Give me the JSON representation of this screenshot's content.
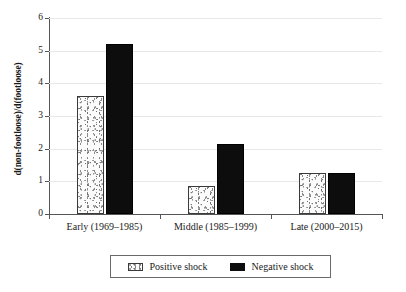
{
  "chart_data": {
    "type": "bar",
    "title": "",
    "xlabel": "",
    "ylabel": "d(non-footloose)/d(footloose)",
    "categories": [
      "Early (1969–1985)",
      "Middle (1985–1999)",
      "Late (2000–2015)"
    ],
    "series": [
      {
        "name": "Positive shock",
        "values": [
          3.6,
          0.85,
          1.25
        ],
        "color": "#fbfbfb",
        "pattern": "stipple"
      },
      {
        "name": "Negative shock",
        "values": [
          5.2,
          2.15,
          1.25
        ],
        "color": "#0d0d0d",
        "pattern": "solid"
      }
    ],
    "ylim": [
      0,
      6
    ],
    "yticks": [
      0,
      1,
      2,
      3,
      4,
      5,
      6
    ],
    "ytick_labels": [
      "0",
      "1",
      "2",
      "3",
      "4",
      "5",
      "6"
    ],
    "grid": true,
    "legend_position": "bottom-center"
  },
  "legend": {
    "entries": [
      {
        "label": "Positive shock"
      },
      {
        "label": "Negative shock"
      }
    ]
  }
}
